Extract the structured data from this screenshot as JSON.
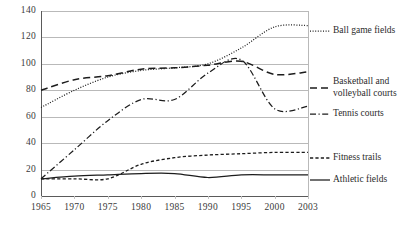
{
  "chart_data": {
    "type": "line",
    "title": "",
    "xlabel": "",
    "ylabel": "",
    "x": [
      1965,
      1970,
      1975,
      1980,
      1985,
      1990,
      1995,
      2000,
      2003
    ],
    "categories": [
      "1965",
      "1970",
      "1975",
      "1980",
      "1985",
      "1990",
      "1995",
      "2000",
      "2003"
    ],
    "xlim": [
      1965,
      2003
    ],
    "ylim": [
      0,
      140
    ],
    "yticks": [
      0,
      20,
      40,
      60,
      80,
      100,
      120,
      140
    ],
    "ytick_labels": [
      "0",
      "20",
      "40",
      "60",
      "80",
      "100",
      "120",
      "140"
    ],
    "grid": "horizontal",
    "legend_position": "right",
    "series": [
      {
        "name": "Ball game fields",
        "style": "dotted",
        "values": [
          67,
          80,
          90,
          95,
          97,
          100,
          112,
          128,
          129
        ]
      },
      {
        "name": "Basketball and volleyball courts",
        "style": "dashed",
        "values": [
          80,
          88,
          91,
          96,
          97,
          99,
          102,
          92,
          94
        ]
      },
      {
        "name": "Tennis courts",
        "style": "dash-dot",
        "values": [
          13,
          35,
          57,
          73,
          73,
          93,
          103,
          66,
          68
        ]
      },
      {
        "name": "Fitness trails",
        "style": "short-dash",
        "values": [
          13,
          13,
          13,
          24,
          29,
          31,
          32,
          33,
          33
        ]
      },
      {
        "name": "Athletic fields",
        "style": "solid",
        "values": [
          13,
          15,
          16,
          17,
          17,
          14,
          16,
          16,
          16
        ]
      }
    ]
  },
  "legend": {
    "items": [
      {
        "label": "Ball game fields",
        "style": "dotted"
      },
      {
        "label": "Basketball and\nvolleyball courts",
        "style": "dashed"
      },
      {
        "label": "Tennis courts",
        "style": "dash-dot"
      },
      {
        "label": "Fitness trails",
        "style": "short-dash"
      },
      {
        "label": "Athletic fields",
        "style": "solid"
      }
    ]
  },
  "colors": {
    "line": "#1c1c1c",
    "grid": "#b9b9b9",
    "axis": "#5a5a5a",
    "text": "#2b2b2b",
    "background": "#ffffff"
  }
}
